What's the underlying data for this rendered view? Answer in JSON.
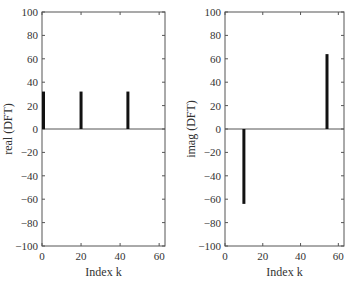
{
  "chart_data": [
    {
      "type": "stem",
      "title": "",
      "xlabel": "Index k",
      "ylabel": "real (DFT)",
      "xlim": [
        0,
        63
      ],
      "ylim": [
        -100,
        100
      ],
      "xticks": [
        0,
        20,
        40,
        60
      ],
      "yticks": [
        -100,
        -80,
        -60,
        -40,
        -20,
        0,
        20,
        40,
        60,
        80,
        100
      ],
      "grid": false,
      "points": [
        {
          "k": 0,
          "value": 32
        },
        {
          "k": 20,
          "value": 32
        },
        {
          "k": 44,
          "value": 32
        }
      ]
    },
    {
      "type": "stem",
      "title": "",
      "xlabel": "Index k",
      "ylabel": "imag (DFT)",
      "xlim": [
        0,
        63
      ],
      "ylim": [
        -100,
        100
      ],
      "xticks": [
        0,
        20,
        40,
        60
      ],
      "yticks": [
        -100,
        -80,
        -60,
        -40,
        -20,
        0,
        20,
        40,
        60,
        80,
        100
      ],
      "grid": false,
      "points": [
        {
          "k": 10,
          "value": -64
        },
        {
          "k": 54,
          "value": 64
        }
      ]
    }
  ],
  "plots": [
    {
      "xlabel": "Index k",
      "ylabel": "real (DFT)"
    },
    {
      "xlabel": "Index k",
      "ylabel": "imag (DFT)"
    }
  ],
  "colors": {
    "stem": "#111111",
    "axis": "#555555",
    "text": "#333333"
  }
}
